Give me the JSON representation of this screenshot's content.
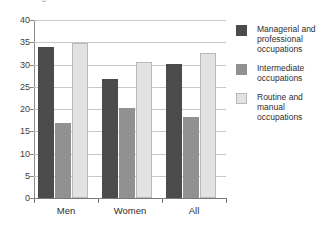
{
  "chart_data": {
    "type": "bar",
    "title": "",
    "supertitle_clipped": "Percentages",
    "categories": [
      "Men",
      "Women",
      "All"
    ],
    "series": [
      {
        "name": "Managerial and professional occupations",
        "values": [
          34,
          26.7,
          30.1
        ],
        "color": "#4b4b4b"
      },
      {
        "name": "Intermediate occupations",
        "values": [
          16.8,
          20.2,
          18.3
        ],
        "color": "#919191"
      },
      {
        "name": "Routine and manual occupations",
        "values": [
          34.9,
          30.5,
          32.6
        ],
        "color": "#e3e3e3"
      }
    ],
    "xlabel": "",
    "ylabel": "",
    "ylim": [
      0,
      40
    ],
    "ytick_step": 5,
    "yticks": [
      "40",
      "35",
      "30",
      "25",
      "20",
      "15",
      "10",
      "5",
      "0"
    ],
    "grid": true,
    "legend_position": "right"
  },
  "legend": {
    "items": [
      {
        "label": "Managerial and professional occupations"
      },
      {
        "label": "Intermediate occupations"
      },
      {
        "label": "Routine and manual occupations"
      }
    ]
  },
  "axis": {
    "x_labels": [
      "Men",
      "Women",
      "All"
    ]
  }
}
